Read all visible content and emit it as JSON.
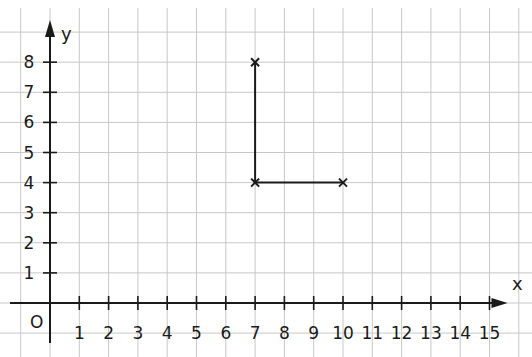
{
  "chart_data": {
    "type": "line",
    "title": "",
    "xlabel": "x",
    "ylabel": "y",
    "origin_label": "O",
    "xlim": [
      0,
      15
    ],
    "ylim": [
      0,
      8
    ],
    "x_ticks": [
      "1",
      "2",
      "3",
      "4",
      "5",
      "6",
      "7",
      "8",
      "9",
      "10",
      "11",
      "12",
      "13",
      "14",
      "15"
    ],
    "y_ticks": [
      "1",
      "2",
      "3",
      "4",
      "5",
      "6",
      "7",
      "8"
    ],
    "grid": true,
    "points": [
      {
        "x": 7,
        "y": 8
      },
      {
        "x": 7,
        "y": 4
      },
      {
        "x": 10,
        "y": 4
      }
    ],
    "segments": [
      {
        "from": {
          "x": 7,
          "y": 8
        },
        "to": {
          "x": 7,
          "y": 4
        }
      },
      {
        "from": {
          "x": 7,
          "y": 4
        },
        "to": {
          "x": 10,
          "y": 4
        }
      }
    ],
    "marker": "x-cross"
  },
  "colors": {
    "grid": "#c8c8c8",
    "ink": "#1a1a1a",
    "background": "#ffffff"
  }
}
